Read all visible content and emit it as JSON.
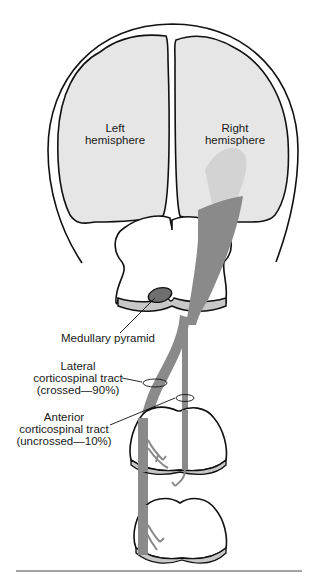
{
  "diagram": {
    "labels": {
      "left_hemisphere": [
        "Left",
        "hemisphere"
      ],
      "right_hemisphere": [
        "Right",
        "hemisphere"
      ],
      "medullary_pyramid": "Medullary pyramid",
      "lateral_tract": [
        "Lateral",
        "corticospinal tract",
        "(crossed—90%)"
      ],
      "anterior_tract": [
        "Anterior",
        "corticospinal tract",
        "(uncrossed—10%)"
      ]
    },
    "colors": {
      "hemisphere_fill": "#e6e6e6",
      "tract_fill": "#8a8a8a",
      "pyramid_fill": "#6f6f6f",
      "section_base": "#c8c8c8",
      "outline": "#111111"
    }
  }
}
